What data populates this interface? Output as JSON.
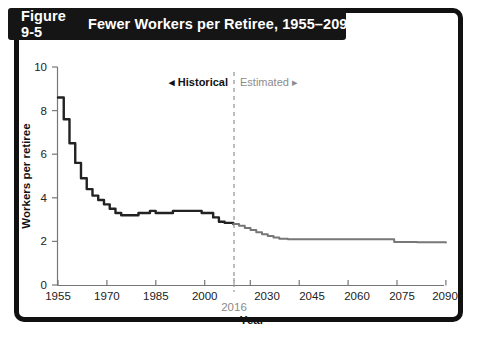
{
  "figure": {
    "number": "Figure 9-5",
    "title": "Fewer Workers per Retiree, 1955–2090"
  },
  "annotations": {
    "historical": "◂ Historical",
    "estimated": "Estimated ▸",
    "divider_year": "2016"
  },
  "colors": {
    "frame": "#111111",
    "banner_bg": "#151515",
    "banner_text": "#ffffff",
    "historical_line": "#222222",
    "estimated_line": "#777777",
    "axis": "#777777",
    "divider": "#9a9a9a",
    "background": "#ffffff"
  },
  "chart_data": {
    "type": "line",
    "title": "Fewer Workers per Retiree, 1955–2090",
    "xlabel": "Year",
    "ylabel": "Workers per retiree",
    "xlim": [
      1955,
      2090
    ],
    "ylim": [
      0,
      10
    ],
    "xticks": [
      1955,
      1970,
      1985,
      2000,
      2030,
      2045,
      2060,
      2075,
      2090
    ],
    "xticklabels": [
      "1955",
      "1970",
      "1985",
      "2000",
      "2030",
      "2045",
      "2060",
      "2075",
      "2090"
    ],
    "special_xtick": {
      "value": 2016,
      "label": "2016",
      "style": "offset-below-gray"
    },
    "yticks": [
      0,
      2,
      4,
      6,
      8,
      10
    ],
    "yticklabels": [
      "0",
      "2",
      "4",
      "6",
      "8",
      "10"
    ],
    "grid": false,
    "legend": "none",
    "divider_x": 2016,
    "series": [
      {
        "name": "Historical",
        "color": "#222222",
        "style": "solid",
        "x": [
          1955,
          1957,
          1959,
          1961,
          1963,
          1965,
          1967,
          1969,
          1971,
          1973,
          1975,
          1977,
          1979,
          1981,
          1983,
          1985,
          1987,
          1989,
          1991,
          1993,
          1995,
          1997,
          1999,
          2001,
          2003,
          2005,
          2007,
          2009,
          2011,
          2013,
          2016
        ],
        "y": [
          8.6,
          7.6,
          6.5,
          5.6,
          4.9,
          4.4,
          4.1,
          3.9,
          3.7,
          3.5,
          3.3,
          3.2,
          3.2,
          3.2,
          3.3,
          3.3,
          3.4,
          3.3,
          3.3,
          3.3,
          3.4,
          3.4,
          3.4,
          3.4,
          3.4,
          3.3,
          3.3,
          3.1,
          2.9,
          2.85,
          2.8
        ]
      },
      {
        "name": "Estimated",
        "color": "#777777",
        "style": "solid",
        "x": [
          2016,
          2018,
          2020,
          2022,
          2024,
          2026,
          2028,
          2030,
          2032,
          2035,
          2040,
          2045,
          2050,
          2055,
          2060,
          2065,
          2070,
          2072,
          2080,
          2090
        ],
        "y": [
          2.8,
          2.72,
          2.62,
          2.52,
          2.42,
          2.33,
          2.25,
          2.18,
          2.12,
          2.1,
          2.1,
          2.1,
          2.1,
          2.1,
          2.1,
          2.1,
          2.1,
          1.97,
          1.96,
          1.95
        ]
      }
    ]
  }
}
